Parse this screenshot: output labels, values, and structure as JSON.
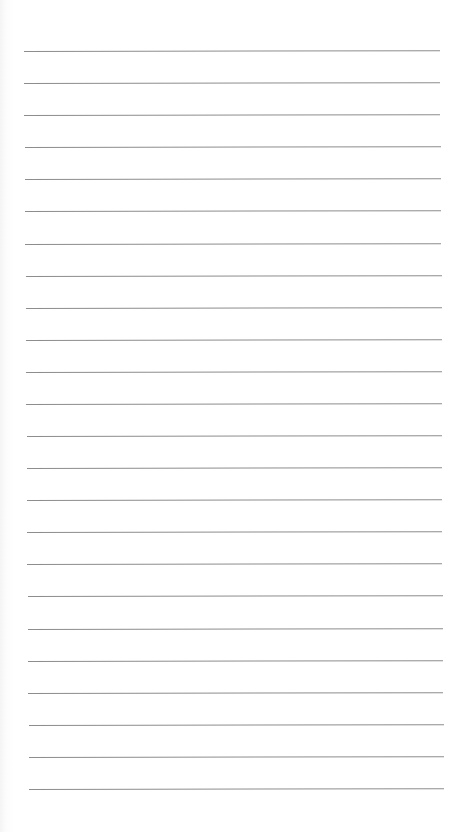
{
  "page": {
    "type": "lined-notepad",
    "line_count": 24,
    "line_color": "#8d8d8d",
    "background_color": "#ffffff",
    "text": ""
  }
}
